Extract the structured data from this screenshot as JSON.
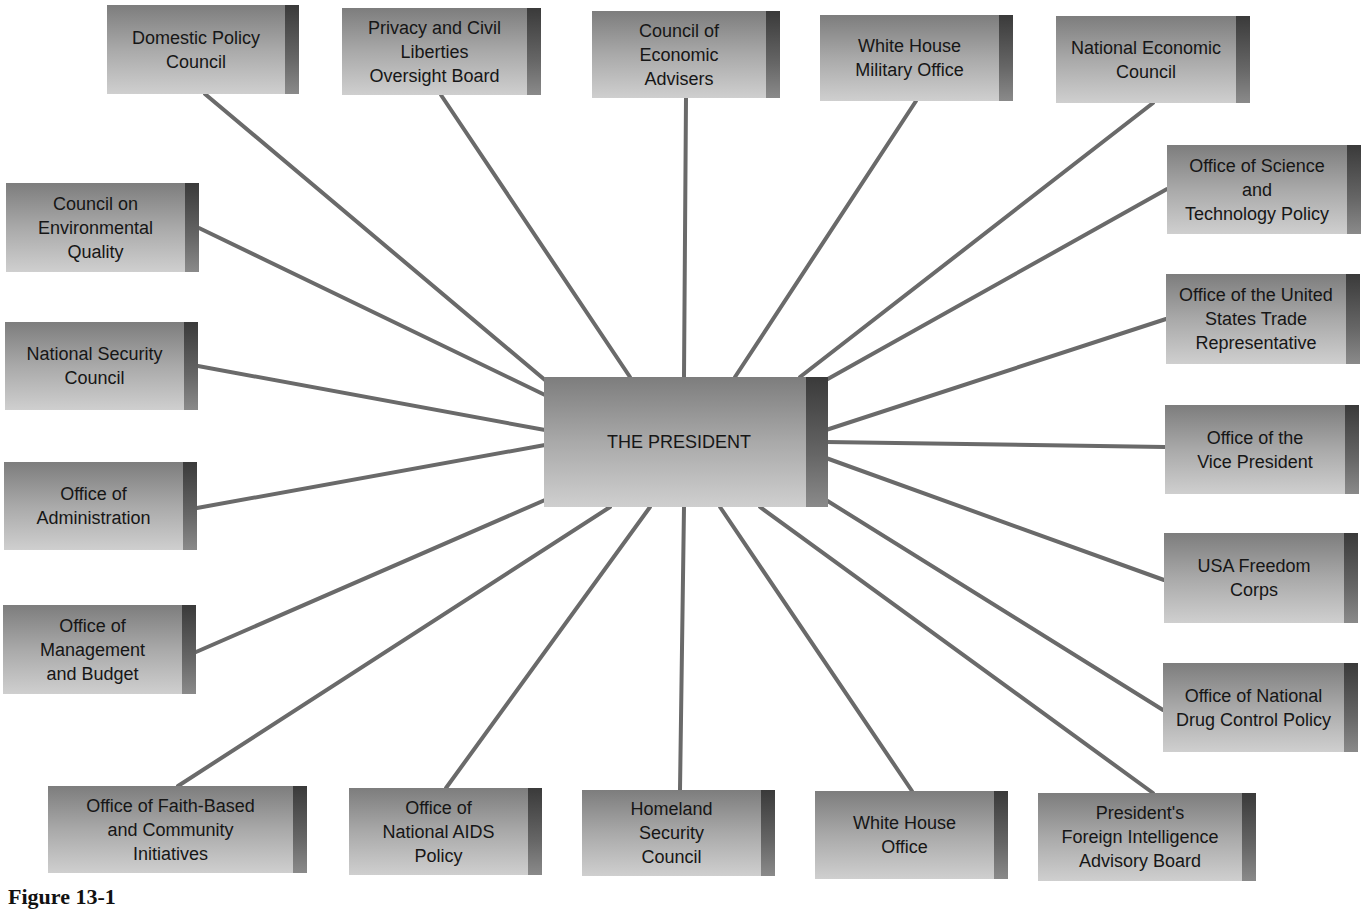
{
  "center": {
    "label": "THE PRESIDENT",
    "x": 544,
    "y": 377,
    "w": 284,
    "h": 130
  },
  "nodes": [
    {
      "id": "domestic-policy-council",
      "label": "Domestic Policy\nCouncil",
      "x": 107,
      "y": 5,
      "w": 192,
      "h": 89,
      "ax": 205,
      "ay": 94
    },
    {
      "id": "privacy-civil-liberties-board",
      "label": "Privacy and Civil\nLiberties\nOversight Board",
      "x": 342,
      "y": 8,
      "w": 199,
      "h": 87,
      "ax": 441,
      "ay": 95
    },
    {
      "id": "council-economic-advisers",
      "label": "Council of\nEconomic\nAdvisers",
      "x": 592,
      "y": 11,
      "w": 188,
      "h": 87,
      "ax": 686,
      "ay": 98
    },
    {
      "id": "white-house-military-office",
      "label": "White House\nMilitary Office",
      "x": 820,
      "y": 15,
      "w": 193,
      "h": 86,
      "ax": 916,
      "ay": 101
    },
    {
      "id": "national-economic-council",
      "label": "National Economic\nCouncil",
      "x": 1056,
      "y": 16,
      "w": 194,
      "h": 87,
      "ax": 1153,
      "ay": 103
    },
    {
      "id": "office-science-technology-policy",
      "label": "Office of Science\nand\nTechnology Policy",
      "x": 1167,
      "y": 145,
      "w": 194,
      "h": 89,
      "ax": 1167,
      "ay": 189
    },
    {
      "id": "office-us-trade-representative",
      "label": "Office of the United\nStates Trade\nRepresentative",
      "x": 1166,
      "y": 274,
      "w": 194,
      "h": 90,
      "ax": 1166,
      "ay": 319
    },
    {
      "id": "office-vice-president",
      "label": "Office of the\nVice President",
      "x": 1165,
      "y": 405,
      "w": 194,
      "h": 89,
      "ax": 1165,
      "ay": 447
    },
    {
      "id": "usa-freedom-corps",
      "label": "USA Freedom\nCorps",
      "x": 1164,
      "y": 533,
      "w": 194,
      "h": 90,
      "ax": 1164,
      "ay": 580
    },
    {
      "id": "office-national-drug-control-policy",
      "label": "Office of National\nDrug Control Policy",
      "x": 1163,
      "y": 663,
      "w": 195,
      "h": 89,
      "ax": 1163,
      "ay": 710
    },
    {
      "id": "council-environmental-quality",
      "label": "Council on\nEnvironmental\nQuality",
      "x": 6,
      "y": 183,
      "w": 193,
      "h": 89,
      "ax": 199,
      "ay": 228
    },
    {
      "id": "national-security-council",
      "label": "National Security\nCouncil",
      "x": 5,
      "y": 322,
      "w": 193,
      "h": 88,
      "ax": 198,
      "ay": 366
    },
    {
      "id": "office-of-administration",
      "label": "Office of\nAdministration",
      "x": 4,
      "y": 462,
      "w": 193,
      "h": 88,
      "ax": 197,
      "ay": 508
    },
    {
      "id": "office-management-budget",
      "label": "Office of\nManagement\nand Budget",
      "x": 3,
      "y": 605,
      "w": 193,
      "h": 89,
      "ax": 196,
      "ay": 652
    },
    {
      "id": "office-faith-based-initiatives",
      "label": "Office of Faith-Based\nand Community\nInitiatives",
      "x": 48,
      "y": 786,
      "w": 259,
      "h": 87,
      "ax": 178,
      "ay": 786
    },
    {
      "id": "office-national-aids-policy",
      "label": "Office of\nNational AIDS\nPolicy",
      "x": 349,
      "y": 788,
      "w": 193,
      "h": 87,
      "ax": 446,
      "ay": 788
    },
    {
      "id": "homeland-security-council",
      "label": "Homeland\nSecurity\nCouncil",
      "x": 582,
      "y": 790,
      "w": 193,
      "h": 86,
      "ax": 680,
      "ay": 790
    },
    {
      "id": "white-house-office",
      "label": "White House\nOffice",
      "x": 815,
      "y": 791,
      "w": 193,
      "h": 88,
      "ax": 912,
      "ay": 791
    },
    {
      "id": "presidents-foreign-intelligence-board",
      "label": "President's\nForeign Intelligence\nAdvisory Board",
      "x": 1038,
      "y": 793,
      "w": 218,
      "h": 88,
      "ax": 1153,
      "ay": 793
    }
  ],
  "center_anchors": [
    {
      "x": 545,
      "y": 380
    },
    {
      "x": 630,
      "y": 377
    },
    {
      "x": 684,
      "y": 377
    },
    {
      "x": 735,
      "y": 377
    },
    {
      "x": 800,
      "y": 377
    },
    {
      "x": 826,
      "y": 380
    },
    {
      "x": 826,
      "y": 430
    },
    {
      "x": 826,
      "y": 442
    },
    {
      "x": 826,
      "y": 458
    },
    {
      "x": 826,
      "y": 500
    },
    {
      "x": 545,
      "y": 395
    },
    {
      "x": 545,
      "y": 430
    },
    {
      "x": 545,
      "y": 445
    },
    {
      "x": 545,
      "y": 500
    },
    {
      "x": 610,
      "y": 507
    },
    {
      "x": 650,
      "y": 507
    },
    {
      "x": 684,
      "y": 507
    },
    {
      "x": 720,
      "y": 507
    },
    {
      "x": 760,
      "y": 507
    }
  ],
  "caption": "Figure 13-1",
  "colors": {
    "line": "#6a6a6a",
    "box_top": "#7d7d7d",
    "box_bottom": "#cfcfcf",
    "box_edge": "#3a3a3a"
  }
}
